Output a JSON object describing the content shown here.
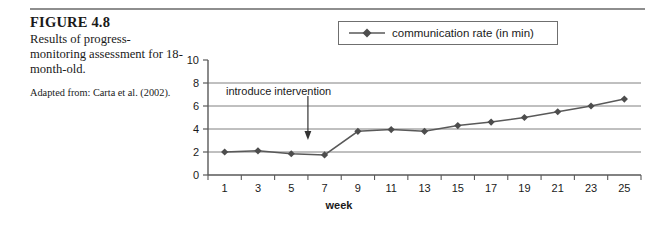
{
  "figure": {
    "number_label": "FIGURE 4.8",
    "description": "Results of progress-monitoring assessment for 18-month-old.",
    "source": "Adapted from: Carta et al. (2002)."
  },
  "legend": {
    "entries": [
      {
        "label": "communication rate (in min)",
        "marker": "diamond",
        "color": "#595959"
      }
    ]
  },
  "annotation": {
    "text": "introduce intervention",
    "arrow": "down-arrow-icon",
    "points_at_week": 6
  },
  "colors": {
    "line": "#595959",
    "marker": "#4d4d4d",
    "gridline": "#808080",
    "axis": "#595959",
    "rule": "#8e8e8e"
  },
  "chart_data": {
    "type": "line",
    "title": "",
    "xlabel": "week",
    "ylabel": "",
    "x": [
      1,
      3,
      5,
      7,
      9,
      11,
      13,
      15,
      17,
      19,
      21,
      23,
      25
    ],
    "xticklabels": [
      "1",
      "3",
      "5",
      "7",
      "9",
      "11",
      "13",
      "15",
      "17",
      "19",
      "21",
      "23",
      "25"
    ],
    "xlim": [
      0,
      26
    ],
    "ylim": [
      0,
      10
    ],
    "yticks": [
      0,
      2,
      4,
      6,
      8,
      10
    ],
    "yticklabels": [
      "0",
      "2",
      "4",
      "6",
      "8",
      "10"
    ],
    "grid": "horizontal",
    "legend_position": "top-right",
    "series": [
      {
        "name": "communication rate (in min)",
        "values": [
          2.0,
          2.1,
          1.85,
          1.75,
          3.8,
          3.95,
          3.8,
          4.3,
          4.6,
          5.0,
          5.5,
          6.0,
          6.6
        ]
      }
    ]
  }
}
